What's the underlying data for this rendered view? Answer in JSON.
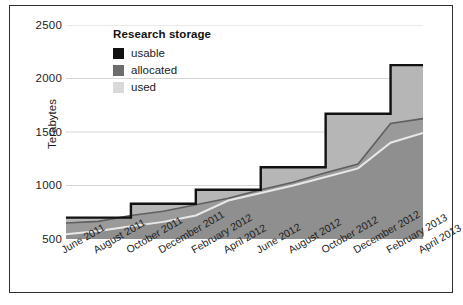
{
  "chart_data": {
    "type": "area",
    "title": "Research storage",
    "xlabel": "",
    "ylabel": "Terabytes",
    "ylim": [
      500,
      2500
    ],
    "yticks": [
      500,
      1000,
      1500,
      2000,
      2500
    ],
    "grid": true,
    "legend_position": "top-left-inside",
    "stacking": "overlaid",
    "categories": [
      "June 2011",
      "August 2011",
      "October 2011",
      "December 2011",
      "February 2012",
      "April 2012",
      "June 2012",
      "August 2012",
      "October 2012",
      "December 2012",
      "February 2013",
      "April 2013"
    ],
    "series": [
      {
        "name": "usable",
        "color": "#111111",
        "values": [
          700,
          700,
          830,
          830,
          960,
          960,
          1170,
          1170,
          1670,
          1670,
          2125,
          2125
        ]
      },
      {
        "name": "allocated",
        "color": "#6d6d6d",
        "values": [
          650,
          665,
          720,
          760,
          820,
          880,
          960,
          1030,
          1120,
          1200,
          1580,
          1625
        ]
      },
      {
        "name": "used",
        "color": "#d9d9d9",
        "values": [
          545,
          575,
          620,
          660,
          720,
          860,
          930,
          1000,
          1080,
          1160,
          1400,
          1490
        ]
      }
    ]
  },
  "legend": {
    "title": "Research storage",
    "items": [
      {
        "label": "usable",
        "color": "#111111"
      },
      {
        "label": "allocated",
        "color": "#6d6d6d"
      },
      {
        "label": "used",
        "color": "#d9d9d9"
      }
    ]
  },
  "axes": {
    "y_title": "Terabytes",
    "y_ticks": [
      "2500",
      "2000",
      "1500",
      "1000",
      "500"
    ]
  },
  "colors": {
    "usable": "#111111",
    "allocated": "#6d6d6d",
    "used": "#d9d9d9",
    "plot_fill": "#9a9a9a",
    "grid": "#d6d6d6",
    "frame": "#2f2f2f",
    "background": "#ffffff",
    "text": "#1c1c1c"
  }
}
